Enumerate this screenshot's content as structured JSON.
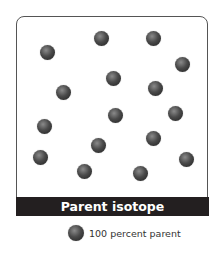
{
  "diagram": {
    "label": "Parent isotope",
    "atom_count": 16,
    "atom_color": "#3a3a3a",
    "legend": {
      "icon": "parent-atom-icon",
      "text": "100 percent parent"
    }
  }
}
